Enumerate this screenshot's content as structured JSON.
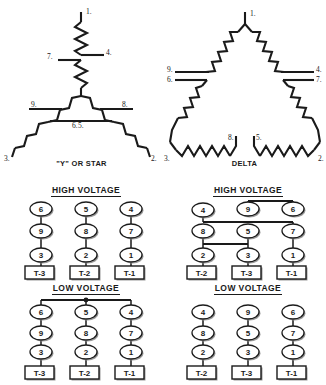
{
  "diagram_title": "Nine-Lead Dual-Voltage Motor Winding and Terminal Connections",
  "schematics": [
    {
      "id": "star",
      "caption": "\"Y\" OR STAR",
      "terminals": [
        "1.",
        "2.",
        "3."
      ],
      "leads": [
        "4.",
        "5.",
        "6.",
        "7.",
        "8.",
        "9."
      ],
      "lead_labels": {
        "top_coil_end": "1.",
        "top_tap_right": "4.",
        "top_tap_left": "7.",
        "left_tap_upper": "9.",
        "left_tap_lower": "6.",
        "left_end": "3.",
        "right_tap_upper": "8.",
        "right_tap_lower": "5.",
        "right_end": "2."
      }
    },
    {
      "id": "delta",
      "caption": "DELTA",
      "terminals": [
        "1.",
        "2.",
        "3."
      ],
      "leads": [
        "4.",
        "5.",
        "6.",
        "7.",
        "8.",
        "9."
      ],
      "lead_labels": {
        "apex": "1.",
        "left_tap_upper": "9.",
        "left_tap_lower": "6.",
        "left_corner": "3.",
        "right_tap_upper": "4.",
        "right_tap_lower": "7.",
        "right_corner": "2.",
        "bottom_left_gap": "8.",
        "bottom_right_gap": "5."
      }
    }
  ],
  "blocks": [
    {
      "id": "star-high",
      "heading": "HIGH VOLTAGE",
      "columns": [
        {
          "nodes": [
            "6",
            "9",
            "3"
          ],
          "terminal": "T-3"
        },
        {
          "nodes": [
            "5",
            "8",
            "2"
          ],
          "terminal": "T-2"
        },
        {
          "nodes": [
            "4",
            "7",
            "1"
          ],
          "terminal": "T-1"
        }
      ],
      "links": "each column chained vertically"
    },
    {
      "id": "star-low",
      "heading": "LOW VOLTAGE",
      "columns": [
        {
          "nodes": [
            "6",
            "9",
            "3"
          ],
          "terminal": "T-3"
        },
        {
          "nodes": [
            "5",
            "8",
            "2"
          ],
          "terminal": "T-2"
        },
        {
          "nodes": [
            "4",
            "7",
            "1"
          ],
          "terminal": "T-1"
        }
      ],
      "links": "top row 6-5-4 tied by common bus bar"
    },
    {
      "id": "delta-high",
      "heading": "HIGH VOLTAGE",
      "columns": [
        {
          "nodes": [
            "4",
            "8",
            "2"
          ],
          "terminal": "T-2"
        },
        {
          "nodes": [
            "9",
            "5",
            "3"
          ],
          "terminal": "T-3"
        },
        {
          "nodes": [
            "6",
            "7",
            "1"
          ],
          "terminal": "T-1"
        }
      ],
      "links": "9 to 6 over top bar; 4 to 7 across middle bar; 8 to 5 across lower bar"
    },
    {
      "id": "delta-low",
      "heading": "LOW VOLTAGE",
      "columns": [
        {
          "nodes": [
            "4",
            "8",
            "2"
          ],
          "terminal": "T-2"
        },
        {
          "nodes": [
            "9",
            "5",
            "3"
          ],
          "terminal": "T-3"
        },
        {
          "nodes": [
            "6",
            "7",
            "1"
          ],
          "terminal": "T-1"
        }
      ],
      "links": "each column chained vertically"
    }
  ],
  "colors": {
    "ink": "#1a1a1a",
    "shadow": "#9a9a9a",
    "background": "#ffffff"
  }
}
